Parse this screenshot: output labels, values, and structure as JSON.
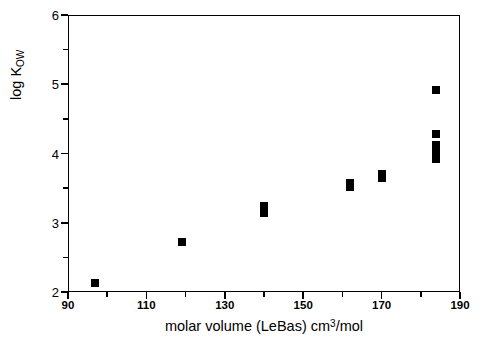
{
  "chart_data": {
    "type": "scatter",
    "title": "",
    "xlabel": "molar volume (LeBas) cm3/mol",
    "xlabel_parts": {
      "before": "molar volume (LeBas) cm",
      "sup": "3",
      "after": "/mol"
    },
    "ylabel": "log KOW",
    "ylabel_parts": {
      "main": "log K",
      "sub": "OW"
    },
    "xlim": [
      90,
      190
    ],
    "ylim": [
      2,
      6
    ],
    "x_major_ticks": [
      90,
      110,
      130,
      150,
      170,
      190
    ],
    "x_minor_ticks": [
      100,
      120,
      140,
      160,
      180
    ],
    "x_tick_labels": [
      "90",
      "110",
      "130",
      "150",
      "170",
      "190"
    ],
    "y_major_ticks": [
      2,
      3,
      4,
      5,
      6
    ],
    "y_minor_ticks": [
      2.5,
      3.5,
      4.5,
      5.5
    ],
    "y_tick_labels": [
      "2",
      "3",
      "4",
      "5",
      "6"
    ],
    "grid": false,
    "legend": null,
    "marker_style": "filled-square",
    "marker_color": "#000000",
    "points": [
      {
        "x": 97,
        "y": 2.13
      },
      {
        "x": 119,
        "y": 2.72
      },
      {
        "x": 140,
        "y": 3.24
      },
      {
        "x": 140,
        "y": 3.14
      },
      {
        "x": 162,
        "y": 3.58
      },
      {
        "x": 162,
        "y": 3.52
      },
      {
        "x": 170,
        "y": 3.7
      },
      {
        "x": 170,
        "y": 3.64
      },
      {
        "x": 184,
        "y": 4.92
      },
      {
        "x": 184,
        "y": 4.28
      },
      {
        "x": 184,
        "y": 4.12
      },
      {
        "x": 184,
        "y": 4.04
      },
      {
        "x": 184,
        "y": 3.92
      }
    ]
  }
}
